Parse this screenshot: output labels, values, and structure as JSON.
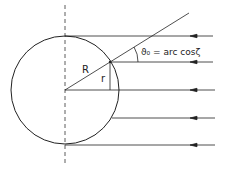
{
  "diagram": {
    "labels": {
      "radius": "R",
      "impact": "r",
      "angle": "ϑ₀ = arc cosζ"
    },
    "circle": {
      "cx": 65,
      "cy": 90,
      "r": 54
    },
    "axis": {
      "x": 65,
      "y1": 5,
      "y2": 165,
      "style": "dashed"
    },
    "rays": [
      {
        "y": 36,
        "x_start": 65,
        "x_end": 215,
        "arrow_x": 193
      },
      {
        "y": 62,
        "x_start": 110,
        "x_end": 215,
        "arrow_x": 193
      },
      {
        "y": 90,
        "x_start": 65,
        "x_end": 215,
        "arrow_x": 193
      },
      {
        "y": 118,
        "x_start": 112,
        "x_end": 215,
        "arrow_x": 193
      },
      {
        "y": 145,
        "x_start": 65,
        "x_end": 215,
        "arrow_x": 193
      }
    ],
    "radial_line": {
      "x1": 65,
      "y1": 90,
      "x2": 189,
      "y2": 13
    },
    "colors": {
      "stroke": "#222222",
      "background": "#ffffff"
    }
  }
}
